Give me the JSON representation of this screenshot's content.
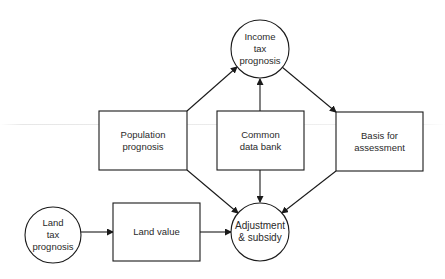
{
  "diagram": {
    "nodes": [
      {
        "id": "income_tax_prognosis",
        "shape": "circle",
        "label": "Income\ntax\nprognosis",
        "cx": 260,
        "cy": 49,
        "r": 29
      },
      {
        "id": "population_prognosis",
        "shape": "rect",
        "label": "Population\nprognosis",
        "x": 99,
        "y": 111,
        "w": 88,
        "h": 59
      },
      {
        "id": "common_data_bank",
        "shape": "rect",
        "label": "Common\ndata bank",
        "x": 217,
        "y": 111,
        "w": 87,
        "h": 59
      },
      {
        "id": "basis_for_assessment",
        "shape": "rect",
        "label": "Basis for\nassessment",
        "x": 336,
        "y": 112,
        "w": 87,
        "h": 59
      },
      {
        "id": "land_tax_prognosis",
        "shape": "circle",
        "label": "Land\ntax\nprognosis",
        "cx": 53,
        "cy": 235,
        "r": 28
      },
      {
        "id": "land_value",
        "shape": "rect",
        "label": "Land value",
        "x": 113,
        "y": 203,
        "w": 87,
        "h": 58
      },
      {
        "id": "adjustment_subsidy",
        "shape": "circle",
        "label": "Adjustment\n& subsidy",
        "cx": 260,
        "cy": 232,
        "r": 29
      }
    ],
    "edges": [
      {
        "from": "population_prognosis",
        "to": "income_tax_prognosis"
      },
      {
        "from": "common_data_bank",
        "to": "income_tax_prognosis"
      },
      {
        "from": "income_tax_prognosis",
        "to": "basis_for_assessment"
      },
      {
        "from": "population_prognosis",
        "to": "adjustment_subsidy"
      },
      {
        "from": "common_data_bank",
        "to": "adjustment_subsidy"
      },
      {
        "from": "basis_for_assessment",
        "to": "adjustment_subsidy"
      },
      {
        "from": "land_tax_prognosis",
        "to": "land_value"
      },
      {
        "from": "land_value",
        "to": "adjustment_subsidy"
      }
    ],
    "colors": {
      "stroke": "#1a1a1a",
      "background": "#ffffff",
      "text": "#2a2a2a"
    }
  },
  "labels": {
    "income_tax_prognosis": "Income\ntax\nprognosis",
    "population_prognosis": "Population\nprognosis",
    "common_data_bank": "Common\ndata bank",
    "basis_for_assessment": "Basis for\nassessment",
    "land_tax_prognosis": "Land\ntax\nprognosis",
    "land_value": "Land value",
    "adjustment_subsidy": "Adjustment\n& subsidy"
  }
}
